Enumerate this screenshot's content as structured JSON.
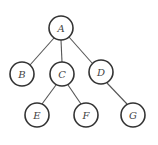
{
  "diagram": {
    "type": "tree",
    "radius": 12,
    "nodes": [
      {
        "id": "A",
        "label": "A",
        "x": 61,
        "y": 28
      },
      {
        "id": "B",
        "label": "B",
        "x": 22,
        "y": 74
      },
      {
        "id": "C",
        "label": "C",
        "x": 62,
        "y": 74
      },
      {
        "id": "D",
        "label": "D",
        "x": 101,
        "y": 72
      },
      {
        "id": "E",
        "label": "E",
        "x": 37,
        "y": 115
      },
      {
        "id": "F",
        "label": "F",
        "x": 86,
        "y": 115
      },
      {
        "id": "G",
        "label": "G",
        "x": 133,
        "y": 115
      }
    ],
    "edges": [
      {
        "from": "A",
        "to": "B"
      },
      {
        "from": "A",
        "to": "C"
      },
      {
        "from": "A",
        "to": "D"
      },
      {
        "from": "C",
        "to": "E"
      },
      {
        "from": "C",
        "to": "F"
      },
      {
        "from": "D",
        "to": "G"
      }
    ]
  }
}
